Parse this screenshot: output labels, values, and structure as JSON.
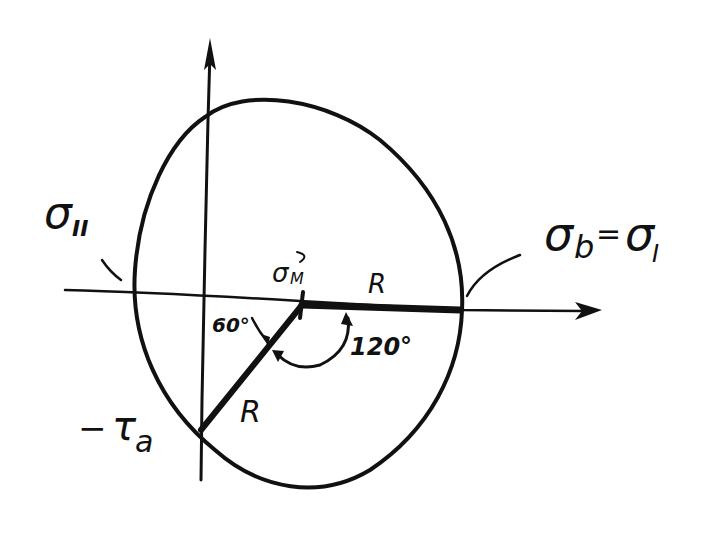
{
  "diagram": {
    "type": "Mohr's circle (hand-drawn)",
    "labels": {
      "sigma_II": {
        "main": "σ",
        "sub": "II"
      },
      "sigma_b_eq_sigma_I": {
        "main": "σ",
        "sub_b": "b",
        "eq": "=",
        "main2": "σ",
        "sub_I": "I"
      },
      "sigma_M": {
        "main": "σ",
        "sub": "M"
      },
      "radius_horizontal": "R",
      "radius_diagonal": "R",
      "angle_60": "60°",
      "angle_120": "120°",
      "tau_a": {
        "minus": "−",
        "main": "τ",
        "sub": "a"
      }
    },
    "axes": {
      "horizontal": "σ axis",
      "vertical": "τ axis"
    },
    "geometry": {
      "center_point": "σ_M",
      "angle_between_radii": "120°",
      "angle_at_vertical_axis": "60°"
    },
    "colors": {
      "ink": "#111111",
      "paper": "#ffffff"
    }
  }
}
